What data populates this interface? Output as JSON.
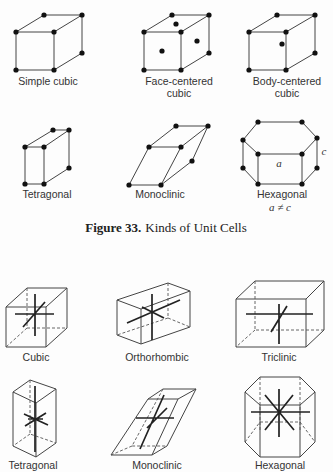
{
  "figure33": {
    "caption_number": "Figure 33.",
    "caption_text": "Kinds of Unit Cells",
    "cells": [
      {
        "label_line1": "Simple cubic",
        "label_line2": ""
      },
      {
        "label_line1": "Face-centered",
        "label_line2": "cubic"
      },
      {
        "label_line1": "Body-centered",
        "label_line2": "cubic"
      },
      {
        "label_line1": "Tetragonal",
        "label_line2": ""
      },
      {
        "label_line1": "Monoclinic",
        "label_line2": ""
      },
      {
        "label_line1": "Hexagonal",
        "label_line2": "a ≠ c",
        "dimension_a": "a",
        "dimension_c": "c"
      }
    ]
  },
  "crystal_systems": {
    "items": [
      {
        "label": "Cubic"
      },
      {
        "label": "Orthorhombic"
      },
      {
        "label": "Triclinic"
      },
      {
        "label": "Tetragonal"
      },
      {
        "label": "Monoclinic"
      },
      {
        "label": "Hexagonal"
      }
    ]
  }
}
